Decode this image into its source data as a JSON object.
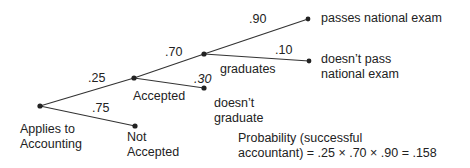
{
  "nodes": {
    "root": "Applies to Accounting",
    "root_line1": "Applies to",
    "root_line2": "Accounting",
    "accepted": "Accepted",
    "not_accepted_line1": "Not",
    "not_accepted_line2": "Accepted",
    "graduates": "graduates",
    "doesnt_graduate_line1": "doesn’t",
    "doesnt_graduate_line2": "graduate",
    "passes": "passes national exam",
    "doesnt_pass_line1": "doesn’t pass",
    "doesnt_pass_line2": "national exam"
  },
  "branches": {
    "accepted": ".25",
    "not_accepted": ".75",
    "graduates": ".70",
    "doesnt_graduate": ".30",
    "passes": ".90",
    "doesnt_pass": ".10"
  },
  "formula": {
    "line1": "Probability (successful",
    "line2": "accountant) = .25 × .70 × .90 = .158"
  }
}
